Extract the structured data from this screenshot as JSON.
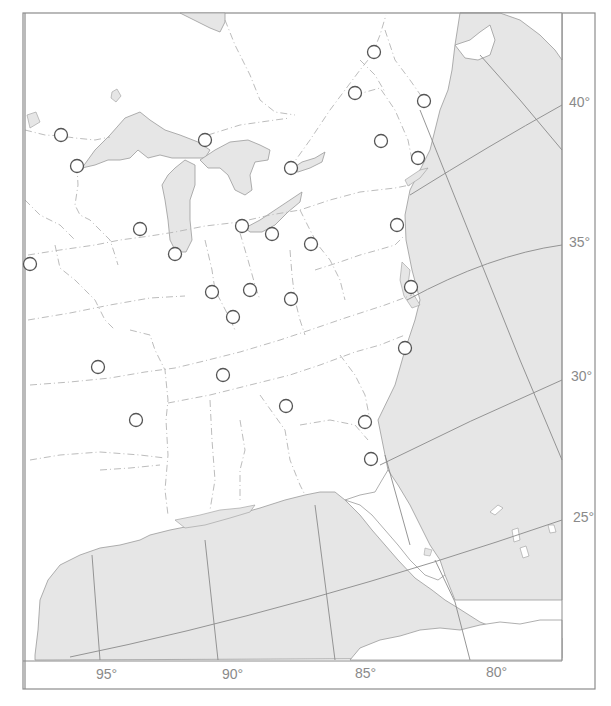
{
  "map": {
    "title": "",
    "colors": {
      "water": "#e6e6e6",
      "land": "#ffffff",
      "frame": "#8c8c8c",
      "graticule": "#8a8a8a",
      "state_border": "#b0b0b0",
      "marker_stroke": "#555555",
      "label": "#8a8a8a"
    },
    "latitude_labels": [
      {
        "text": "40°",
        "x": 569,
        "y": 95
      },
      {
        "text": "35°",
        "x": 569,
        "y": 235
      },
      {
        "text": "30°",
        "x": 571,
        "y": 369
      },
      {
        "text": "25°",
        "x": 573,
        "y": 510
      }
    ],
    "longitude_labels": [
      {
        "text": "95°",
        "x": 96,
        "y": 671
      },
      {
        "text": "90°",
        "x": 222,
        "y": 671
      },
      {
        "text": "85°",
        "x": 355,
        "y": 670
      },
      {
        "text": "80°",
        "x": 486,
        "y": 669
      }
    ],
    "markers": [
      {
        "x": 374,
        "y": 52
      },
      {
        "x": 355,
        "y": 93
      },
      {
        "x": 424,
        "y": 101
      },
      {
        "x": 61,
        "y": 135
      },
      {
        "x": 205,
        "y": 140
      },
      {
        "x": 381,
        "y": 141
      },
      {
        "x": 77,
        "y": 166
      },
      {
        "x": 291,
        "y": 168
      },
      {
        "x": 418,
        "y": 158
      },
      {
        "x": 140,
        "y": 229
      },
      {
        "x": 242,
        "y": 226
      },
      {
        "x": 272,
        "y": 234
      },
      {
        "x": 397,
        "y": 225
      },
      {
        "x": 311,
        "y": 244
      },
      {
        "x": 175,
        "y": 254
      },
      {
        "x": 30,
        "y": 264
      },
      {
        "x": 212,
        "y": 292
      },
      {
        "x": 250,
        "y": 290
      },
      {
        "x": 291,
        "y": 299
      },
      {
        "x": 411,
        "y": 287
      },
      {
        "x": 233,
        "y": 317
      },
      {
        "x": 405,
        "y": 348
      },
      {
        "x": 98,
        "y": 367
      },
      {
        "x": 223,
        "y": 375
      },
      {
        "x": 286,
        "y": 406
      },
      {
        "x": 136,
        "y": 420
      },
      {
        "x": 365,
        "y": 422
      },
      {
        "x": 371,
        "y": 459
      }
    ]
  }
}
